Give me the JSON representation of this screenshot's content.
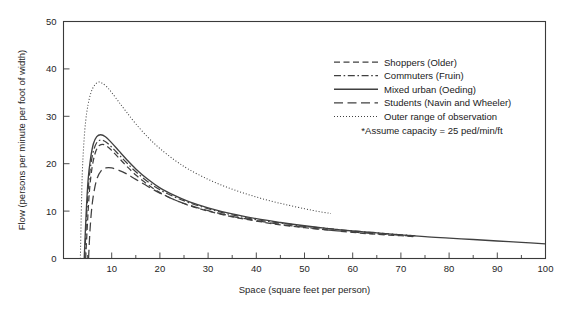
{
  "chart_data": {
    "type": "line",
    "title": "",
    "xlabel": "Space (square feet per person)",
    "ylabel": "Flow (persons per minute per foot of width)",
    "xlim": [
      0,
      100
    ],
    "ylim": [
      0,
      50
    ],
    "xticks": [
      0,
      10,
      20,
      30,
      40,
      50,
      60,
      70,
      80,
      90,
      100
    ],
    "yticks": [
      0,
      10,
      20,
      30,
      40,
      50
    ],
    "xminor_step": 5,
    "grid": false,
    "legend_position": "upper-right",
    "annotations": [
      "*Assume capacity = 25 ped/min/ft"
    ],
    "series": [
      {
        "name": "Shoppers (Older)",
        "style": "dashed",
        "points": [
          [
            4.6,
            0
          ],
          [
            5.0,
            8.0
          ],
          [
            5.4,
            14.5
          ],
          [
            5.9,
            19.0
          ],
          [
            6.5,
            22.0
          ],
          [
            7.2,
            23.6
          ],
          [
            8.0,
            24.1
          ],
          [
            9.0,
            23.7
          ],
          [
            10.0,
            22.8
          ],
          [
            11.5,
            21.2
          ],
          [
            13.0,
            19.6
          ],
          [
            15.0,
            17.6
          ],
          [
            17.5,
            15.6
          ],
          [
            20.0,
            13.9
          ],
          [
            23.0,
            12.4
          ],
          [
            26.0,
            11.2
          ],
          [
            30.0,
            10.0
          ],
          [
            35.0,
            8.8
          ],
          [
            40.0,
            7.9
          ],
          [
            45.0,
            7.1
          ],
          [
            50.0,
            6.5
          ],
          [
            55.0,
            6.0
          ],
          [
            60.0,
            5.5
          ],
          [
            65.0,
            5.1
          ],
          [
            70.0,
            4.8
          ],
          [
            73.0,
            4.6
          ]
        ]
      },
      {
        "name": "Commuters (Fruin)",
        "style": "dashdot",
        "points": [
          [
            4.4,
            0
          ],
          [
            4.8,
            9.0
          ],
          [
            5.2,
            15.5
          ],
          [
            5.7,
            20.0
          ],
          [
            6.3,
            23.0
          ],
          [
            7.0,
            24.6
          ],
          [
            7.8,
            25.0
          ],
          [
            8.8,
            24.6
          ],
          [
            10.0,
            23.5
          ],
          [
            11.5,
            21.9
          ],
          [
            13.0,
            20.3
          ],
          [
            15.0,
            18.3
          ],
          [
            17.5,
            16.2
          ],
          [
            20.0,
            14.5
          ],
          [
            23.0,
            13.0
          ],
          [
            26.0,
            11.8
          ],
          [
            30.0,
            10.5
          ],
          [
            35.0,
            9.2
          ],
          [
            40.0,
            8.2
          ],
          [
            45.0,
            7.5
          ],
          [
            50.0,
            6.8
          ],
          [
            55.0,
            6.3
          ],
          [
            60.0,
            5.8
          ],
          [
            65.0,
            5.4
          ],
          [
            70.0,
            5.0
          ],
          [
            73.0,
            4.8
          ]
        ]
      },
      {
        "name": "Mixed urban (Oeding)",
        "style": "solid",
        "points": [
          [
            4.3,
            0
          ],
          [
            4.7,
            9.5
          ],
          [
            5.1,
            16.5
          ],
          [
            5.6,
            21.0
          ],
          [
            6.2,
            24.2
          ],
          [
            6.9,
            25.7
          ],
          [
            7.7,
            26.1
          ],
          [
            8.7,
            25.7
          ],
          [
            10.0,
            24.4
          ],
          [
            11.5,
            22.7
          ],
          [
            13.0,
            21.0
          ],
          [
            15.0,
            18.9
          ],
          [
            17.5,
            16.7
          ],
          [
            20.0,
            14.9
          ],
          [
            23.0,
            13.3
          ],
          [
            26.0,
            12.0
          ],
          [
            30.0,
            10.7
          ],
          [
            35.0,
            9.4
          ],
          [
            40.0,
            8.4
          ],
          [
            45.0,
            7.6
          ],
          [
            50.0,
            6.9
          ],
          [
            55.0,
            6.3
          ],
          [
            60.0,
            5.8
          ],
          [
            65.0,
            5.4
          ],
          [
            70.0,
            5.0
          ],
          [
            75.0,
            4.6
          ],
          [
            80.0,
            4.3
          ],
          [
            85.0,
            4.0
          ],
          [
            90.0,
            3.7
          ],
          [
            95.0,
            3.4
          ],
          [
            100.0,
            3.1
          ]
        ]
      },
      {
        "name": "Students (Navin and Wheeler)",
        "style": "longdash",
        "points": [
          [
            5.2,
            0
          ],
          [
            5.5,
            6.0
          ],
          [
            5.9,
            11.0
          ],
          [
            6.4,
            14.5
          ],
          [
            7.0,
            17.0
          ],
          [
            7.8,
            18.5
          ],
          [
            8.8,
            19.1
          ],
          [
            10.0,
            19.1
          ],
          [
            11.5,
            18.6
          ],
          [
            13.0,
            17.9
          ],
          [
            15.0,
            16.7
          ],
          [
            17.5,
            15.2
          ],
          [
            20.0,
            13.8
          ],
          [
            23.0,
            12.4
          ],
          [
            26.0,
            11.3
          ],
          [
            30.0,
            10.1
          ],
          [
            35.0,
            8.9
          ],
          [
            40.0,
            8.0
          ],
          [
            45.0,
            7.2
          ],
          [
            50.0,
            6.6
          ],
          [
            55.0,
            6.0
          ],
          [
            60.0,
            5.6
          ],
          [
            65.0,
            5.2
          ],
          [
            70.0,
            4.9
          ],
          [
            73.0,
            4.7
          ]
        ]
      },
      {
        "name": "Outer range of observation",
        "style": "dotted",
        "points": [
          [
            3.5,
            0
          ],
          [
            3.7,
            10.0
          ],
          [
            3.9,
            18.0
          ],
          [
            4.2,
            24.0
          ],
          [
            4.6,
            29.0
          ],
          [
            5.1,
            32.5
          ],
          [
            5.7,
            35.0
          ],
          [
            6.4,
            36.5
          ],
          [
            7.2,
            37.2
          ],
          [
            8.0,
            37.0
          ],
          [
            9.0,
            36.2
          ],
          [
            10.0,
            35.0
          ],
          [
            11.5,
            33.0
          ],
          [
            13.0,
            31.0
          ],
          [
            15.0,
            28.4
          ],
          [
            17.5,
            25.6
          ],
          [
            20.0,
            23.2
          ],
          [
            23.0,
            20.8
          ],
          [
            26.0,
            18.8
          ],
          [
            30.0,
            16.7
          ],
          [
            34.0,
            15.0
          ],
          [
            38.0,
            13.6
          ],
          [
            42.0,
            12.4
          ],
          [
            46.0,
            11.4
          ],
          [
            50.0,
            10.5
          ],
          [
            53.0,
            9.9
          ],
          [
            55.5,
            9.5
          ]
        ]
      }
    ]
  },
  "legend": {
    "items": [
      {
        "label": "Shoppers (Older)",
        "style": "dashed"
      },
      {
        "label": "Commuters (Fruin)",
        "style": "dashdot"
      },
      {
        "label": "Mixed urban (Oeding)",
        "style": "solid"
      },
      {
        "label": "Students (Navin and Wheeler)",
        "style": "longdash"
      },
      {
        "label": "Outer range of observation",
        "style": "dotted"
      }
    ],
    "footnote": "*Assume capacity = 25 ped/min/ft"
  },
  "colors": {
    "axis": "#3a3a3a",
    "curve": "#404040",
    "text": "#1a1a1a",
    "background": "#ffffff"
  }
}
